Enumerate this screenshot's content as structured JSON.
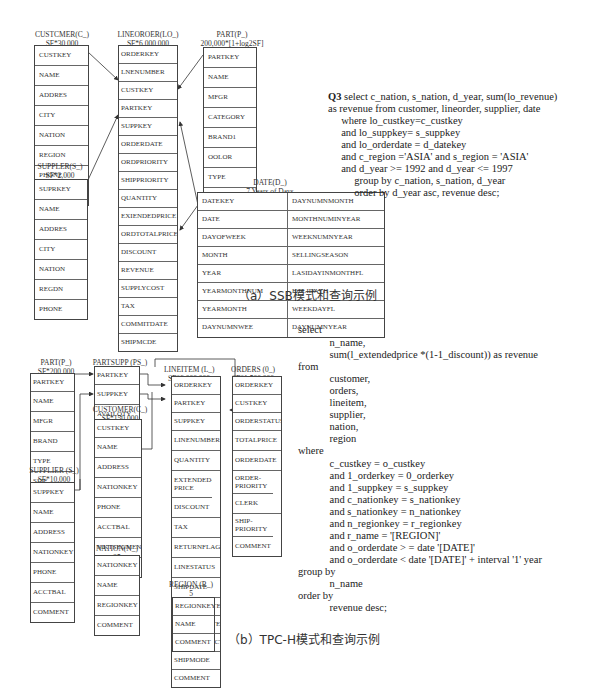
{
  "ssb": {
    "customer": {
      "title": "CUSTCMER(C_)",
      "size": "SF*30,000",
      "fields": [
        "CUSTKEY",
        "NAME",
        "ADDRES",
        "CITY",
        "NATION",
        "REGION",
        "PHONE",
        "MKTSEGMENT"
      ]
    },
    "supplier": {
      "title": "SUPPLER(S_)",
      "size": "SF*2,000",
      "fields": [
        "SUPRKEY",
        "NAME",
        "ADDRES",
        "CITY",
        "NATION",
        "REGDN",
        "PHONE"
      ]
    },
    "lineorder": {
      "title": "LINEOROER(LO_)",
      "size": "SF*6,000,000",
      "fields": [
        "ORDERKEY",
        "LNENUMBER",
        "CUSTKEY",
        "PARTKEY",
        "SUPPKEY",
        "ORDERDATE",
        "ORDPRIORITY",
        "SHIPPRIORITY",
        "QUANTITY",
        "EXIENDEDPRICE",
        "ORDTOTALPRICE",
        "DISCOUNT",
        "REVENUE",
        "SUPPLYCOST",
        "TAX",
        "COMMITDATE",
        "SHIPMCDE"
      ]
    },
    "part": {
      "title": "PART(P_)",
      "size": "200,000*[1+log2SF]",
      "fields": [
        "PARTKEY",
        "NAME",
        "MFGR",
        "CATEGORY",
        "BRAND1",
        "OOLOR",
        "TYPE",
        "SIZE",
        "OONTAINER"
      ]
    },
    "date": {
      "title": "DATE(D_)",
      "size": "7 Years of Days",
      "fields": [
        [
          "DATEKEY",
          "DAYNUMNMONTH"
        ],
        [
          "DATE",
          "MONTHNUMINYEAR"
        ],
        [
          "DAYOFWEEK",
          "WEEKNUMNYEAR"
        ],
        [
          "MONTH",
          "SELLINGSEASON"
        ],
        [
          "YEAR",
          "LASIDAYINMONTHFL"
        ],
        [
          "YEARMONTHNUM",
          "HOLIDAYH"
        ],
        [
          "YEARMONTH",
          "WEEKDAYFL"
        ],
        [
          "DAYNUMNWEE",
          "DAYNUMNYEAR"
        ]
      ]
    },
    "query": {
      "label": "Q3",
      "lines": [
        " select c_nation, s_nation, d_year, sum(lo_revenue)",
        "as revenue from customer, lineorder, supplier, date",
        "     where lo_custkey=c_custkey",
        "     and lo_suppkey= s_suppkey",
        "     and lo_orderdate = d_datekey",
        "     and c_region ='ASIA' and s_region = 'ASIA'",
        "     and d_year >= 1992 and d_year <= 1997",
        "          group by c_nation, s_nation, d_year",
        "          order by d_year asc, revenue desc;"
      ]
    },
    "caption": "（a）SSB模式和查询示例"
  },
  "tpch": {
    "part": {
      "title": "PART(P_)",
      "size": "SF*200,000",
      "fields": [
        "PARTKEY",
        "NAME",
        "MFGR",
        "BRAND",
        "TYPE",
        "SIZE",
        "CONTAINER",
        "RETAILPRICE",
        "COMMENT"
      ]
    },
    "supplier": {
      "title": "SUPPLIER (S_)",
      "size": "SF*10,000",
      "fields": [
        "SUPPKEY",
        "NAME",
        "ADDRESS",
        "NATIONKEY",
        "PHONE",
        "ACCTBAL",
        "COMMENT"
      ]
    },
    "partsupp": {
      "title": "PARTSUPP (PS_)",
      "size": "SF*800,000",
      "fields": [
        "PARTKEY",
        "SUPPKEY",
        "AVAILQTY",
        "SUPPLYCOST",
        "COMMENT"
      ]
    },
    "customer": {
      "title": "CUSTOMER(C_)",
      "size": "SF*150,000",
      "fields": [
        "CUSTKEY",
        "NAME",
        "ADDRESS",
        "NATIONKEY",
        "PHONE",
        "ACCTBAL",
        "MKTSEGMENT",
        "COMMENT"
      ]
    },
    "nation": {
      "title": "NATION(N_)",
      "size": "25",
      "fields": [
        "NATIONKEY",
        "NAME",
        "REGIONKEY",
        "COMMENT"
      ]
    },
    "lineitem": {
      "title": "LINEITEM (L_)",
      "size": "SF*6,000,000",
      "fields": [
        "ORDERKEY",
        "PARTKEY",
        "SUPPKEY",
        "LINENUMBER",
        "QUANTITY",
        "EXTENDED-PRICE",
        "DISCOUNT",
        "TAX",
        "RETURNFLAG",
        "LINESTATUS",
        "SHIPDATE",
        "COMMITDATE",
        "RECEIPTDATE",
        "SHIPINSTRUCT",
        "SHIPMODE",
        "COMMENT"
      ]
    },
    "region": {
      "title": "REGION (R_)",
      "size": "5",
      "fields": [
        "REGIONKEY",
        "NAME",
        "COMMENT"
      ]
    },
    "orders": {
      "title": "ORDERS (0_)",
      "size": "SF*1,500,000",
      "fields": [
        "ORDERKEY",
        "CUSTKEY",
        "ORDERSTATUS",
        "TOTALPRICE",
        "ORDERDATE",
        "ORDER-PRIORITY",
        "CLERK",
        "SHIP-PRIORITY",
        "COMMENT"
      ]
    },
    "query": {
      "lines": [
        "select",
        "            n_name,",
        "            sum(l_extendedprice *(1-1_discount)) as revenue",
        "from",
        "            customer,",
        "            orders,",
        "            lineitem,",
        "            supplier,",
        "            nation,",
        "            region",
        "where",
        "            c_custkey = o_custkey",
        "            and 1_orderkey = 0_orderkey",
        "            and 1_suppkey = s_suppkey",
        "            and c_nationkey = s_nationkey",
        "            and s_nationkey = n_nationkey",
        "            and n_regionkey = r_regionkey",
        "            and r_name = '[REGION]'",
        "            and o_orderdate > = date '[DATE]'",
        "            and o_orderdate < date '[DATE]' + interval '1' year",
        "group by",
        "            n_name",
        "order by",
        "            revenue desc;"
      ]
    },
    "caption": "（b）TPC-H模式和查询示例"
  }
}
